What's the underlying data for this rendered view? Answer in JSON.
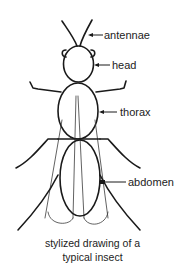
{
  "diagram": {
    "caption_lines": [
      "stylized drawing of a",
      "typical insect"
    ],
    "labels": {
      "antennae": "antennae",
      "head": "head",
      "thorax": "thorax",
      "abdomen": "abdomen"
    },
    "colors": {
      "background": "#ffffff",
      "ink": "#1a1a1a"
    }
  }
}
